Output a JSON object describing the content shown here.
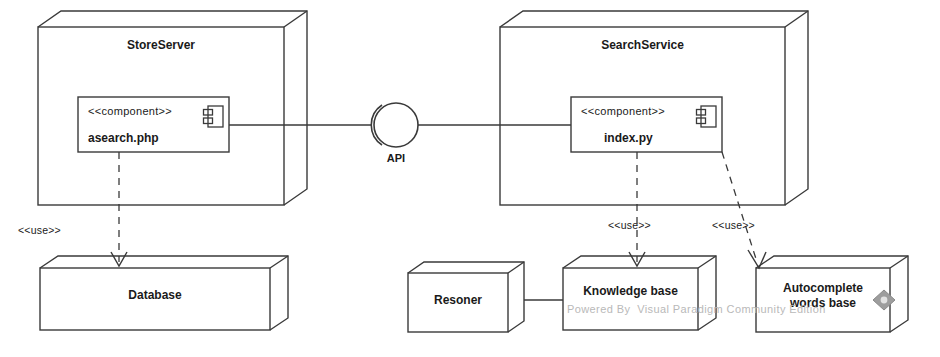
{
  "diagram": {
    "type": "uml-component-diagram",
    "tool_watermark": "Powered By  Visual Paradigm Community Edition",
    "stroke_color": "#3a3a3a",
    "text_color": "#1a1a1a",
    "watermark_color": "#b9b9b9",
    "background": "#ffffff"
  },
  "nodes": [
    {
      "id": "store-server",
      "label": "StoreServer"
    },
    {
      "id": "search-service",
      "label": "SearchService"
    }
  ],
  "components": [
    {
      "id": "asearch",
      "stereotype": "<<component>>",
      "name": "asearch.php",
      "icon": "component-icon"
    },
    {
      "id": "index",
      "stereotype": "<<component>>",
      "name": "index.py",
      "icon": "component-icon"
    }
  ],
  "interface": {
    "id": "api",
    "label": "API",
    "notation": "ball-and-socket"
  },
  "artifacts": [
    {
      "id": "database",
      "label": "Database"
    },
    {
      "id": "resoner",
      "label": "Resoner"
    },
    {
      "id": "knowledge-base",
      "label": "Knowledge base"
    },
    {
      "id": "autocomplete",
      "label_line1": "Autocomplete",
      "label_line2": "words base"
    }
  ],
  "dependencies": [
    {
      "id": "use-database",
      "label": "<<use>>",
      "from": "asearch",
      "to": "database"
    },
    {
      "id": "use-knowledge-base",
      "label": "<<use>>",
      "from": "index",
      "to": "knowledge-base"
    },
    {
      "id": "use-autocomplete",
      "label": "<<use>>",
      "from": "index",
      "to": "autocomplete"
    }
  ],
  "associations": [
    {
      "id": "assoc-resoner-knowledge",
      "from": "resoner",
      "to": "knowledge-base"
    }
  ]
}
